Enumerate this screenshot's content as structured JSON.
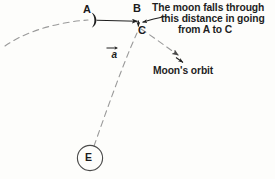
{
  "figure": {
    "background_color": "#fdfdfb",
    "ink_color": "#1f1f1f",
    "dash_color": "#9a9a9a"
  },
  "points": {
    "a_label": "A",
    "b_label": "B",
    "c_label": "C",
    "e_label": "E"
  },
  "vector": {
    "symbol": "a",
    "name": "acceleration-vector"
  },
  "callout": {
    "line1": "The moon falls through",
    "line2": "this distance in going",
    "line3": "from A to C"
  },
  "orbit": {
    "label": "Moon's orbit"
  },
  "icons": {
    "moon": "crescent-moon-icon",
    "earth": "earth-circle-icon",
    "arrow": "arrow-icon"
  }
}
